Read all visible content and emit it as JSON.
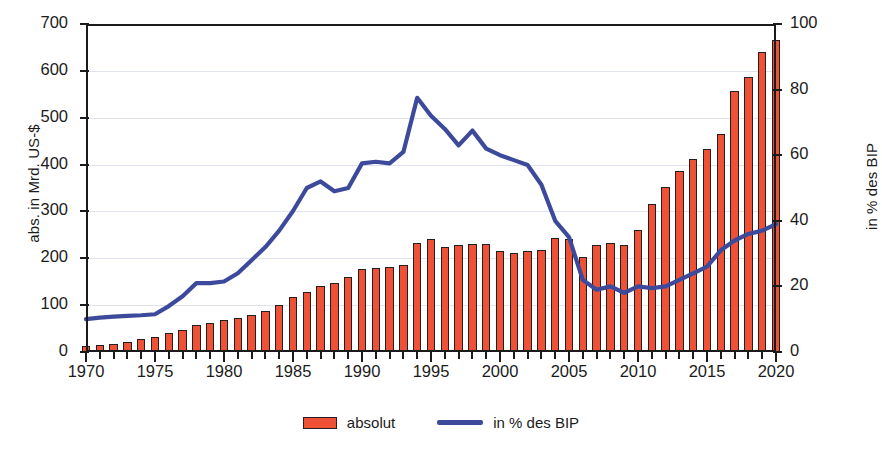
{
  "chart_data": {
    "type": "bar",
    "title": "",
    "subtitle": "",
    "xlabel": "",
    "ylabel": "abs. in Mrd. US-$",
    "y2label": "in % des BIP",
    "ylim": [
      0,
      700
    ],
    "y2lim": [
      0,
      100
    ],
    "yticks": [
      0,
      100,
      200,
      300,
      400,
      500,
      600,
      700
    ],
    "y2ticks": [
      0,
      20,
      40,
      60,
      80,
      100
    ],
    "xlim": [
      1970,
      2020
    ],
    "xticks": [
      1970,
      1975,
      1980,
      1985,
      1990,
      1995,
      2000,
      2005,
      2010,
      2015,
      2020
    ],
    "xtick_step_minor": 1,
    "grid": true,
    "grid_axis": "y",
    "legend_position": "bottom",
    "x": [
      1970,
      1971,
      1972,
      1973,
      1974,
      1975,
      1976,
      1977,
      1978,
      1979,
      1980,
      1981,
      1982,
      1983,
      1984,
      1985,
      1986,
      1987,
      1988,
      1989,
      1990,
      1991,
      1992,
      1993,
      1994,
      1995,
      1996,
      1997,
      1998,
      1999,
      2000,
      2001,
      2002,
      2003,
      2004,
      2005,
      2006,
      2007,
      2008,
      2009,
      2010,
      2011,
      2012,
      2013,
      2014,
      2015,
      2016,
      2017,
      2018,
      2019,
      2020
    ],
    "series": [
      {
        "name": "absolut",
        "type": "bar",
        "axis": "left",
        "unit": "Mrd. US-$",
        "color": "#ef5136",
        "edge_color": "#231f20",
        "values": [
          12,
          15,
          18,
          22,
          28,
          32,
          40,
          48,
          58,
          62,
          68,
          72,
          80,
          88,
          100,
          118,
          128,
          140,
          148,
          160,
          178,
          180,
          182,
          185,
          232,
          241,
          225,
          228,
          230,
          230,
          215,
          212,
          215,
          218,
          243,
          242,
          202,
          228,
          232,
          228,
          260,
          315,
          353,
          387,
          412,
          433,
          466,
          558,
          587,
          641,
          666
        ]
      },
      {
        "name": "in % des BIP",
        "type": "line",
        "axis": "right",
        "unit": "% des BIP",
        "color": "#3d4a9c",
        "values": [
          10,
          10.5,
          10.8,
          11,
          11.2,
          11.5,
          14,
          17,
          21,
          21,
          21.5,
          24,
          28,
          32,
          37,
          43,
          50,
          52,
          49,
          50,
          57.5,
          58,
          57.5,
          61,
          77.5,
          72,
          68,
          63,
          67.5,
          62,
          60,
          58.5,
          57,
          51,
          40,
          35,
          22,
          19,
          20,
          18,
          20,
          19.5,
          20,
          22,
          24,
          26,
          31,
          34,
          36,
          37,
          39
        ]
      }
    ]
  },
  "legend": {
    "items": [
      {
        "label": "absolut",
        "marker": "bar-swatch",
        "color": "#ef5136"
      },
      {
        "label": "in % des BIP",
        "marker": "line-swatch",
        "color": "#3d4a9c"
      }
    ]
  },
  "colors": {
    "bar": "#ef5136",
    "bar_edge": "#231f20",
    "line": "#3d4a9c",
    "axis": "#1b1b1b",
    "grid": "#dfe2ef",
    "background": "#ffffff"
  }
}
